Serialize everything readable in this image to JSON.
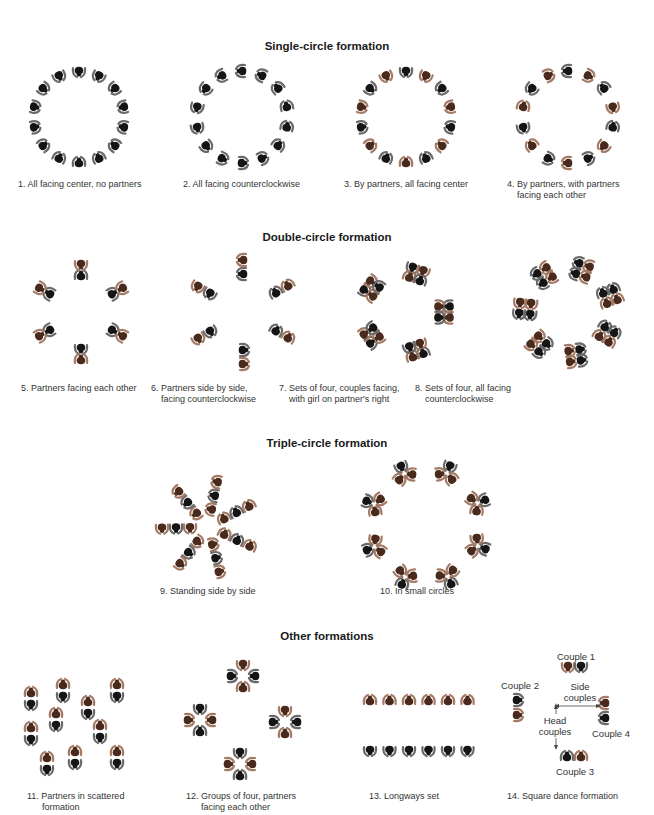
{
  "colors": {
    "man": "#151515",
    "man_arm": "#6a6a6a",
    "woman": "#4a2a1c",
    "woman_arm": "#a57b66",
    "line": "#444444"
  },
  "sections": [
    {
      "id": "single",
      "title": "Single-circle formation",
      "y": 46
    },
    {
      "id": "double",
      "title": "Double-circle formation",
      "y": 237
    },
    {
      "id": "triple",
      "title": "Triple-circle formation",
      "y": 443
    },
    {
      "id": "other",
      "title": "Other formations",
      "y": 636
    }
  ],
  "captions": [
    {
      "n": 1,
      "text": "1. All facing center, no partners",
      "x": 18,
      "y": 183,
      "w": 130,
      "align": "left"
    },
    {
      "n": 2,
      "text": "2. All facing counterclockwise",
      "x": 183,
      "y": 183,
      "w": 130,
      "align": "left"
    },
    {
      "n": 3,
      "text": "3. By partners, all facing center",
      "x": 343,
      "y": 183,
      "w": 140,
      "align": "left"
    },
    {
      "n": 4,
      "text": "4. By partners, with partners\n    facing each other",
      "x": 505,
      "y": 183,
      "w": 140,
      "align": "left"
    },
    {
      "n": 5,
      "text": "5. Partners facing each other",
      "x": 21,
      "y": 383,
      "w": 130,
      "align": "left"
    },
    {
      "n": 6,
      "text": "6. Partners side by side,\n    facing counterclockwise",
      "x": 187,
      "y": 383,
      "w": 130,
      "align": "left"
    },
    {
      "n": 7,
      "text": "7. Sets of four, couples facing,\n    with girl on partner's right",
      "x": 343,
      "y": 383,
      "w": 140,
      "align": "left"
    },
    {
      "n": 8,
      "text": "8. Sets of four, all facing\n    counterclockwise",
      "x": 512,
      "y": 383,
      "w": 130,
      "align": "left"
    },
    {
      "n": 9,
      "text": "9. Standing side by side",
      "x": 160,
      "y": 590,
      "w": 130,
      "align": "left"
    },
    {
      "n": 10,
      "text": "10. In small circles",
      "x": 380,
      "y": 590,
      "w": 130,
      "align": "left"
    },
    {
      "n": 11,
      "text": "11. Partners in scattered\n      formation",
      "x": 27,
      "y": 792,
      "w": 130,
      "align": "left"
    },
    {
      "n": 12,
      "text": "12. Groups of four, partners\n      facing each other",
      "x": 186,
      "y": 792,
      "w": 130,
      "align": "left"
    },
    {
      "n": 13,
      "text": "13. Longways set",
      "x": 370,
      "y": 792,
      "w": 130,
      "align": "left"
    },
    {
      "n": 14,
      "text": "14. Square dance formation",
      "x": 507,
      "y": 792,
      "w": 140,
      "align": "left"
    }
  ],
  "square_labels": [
    {
      "text": "Couple 1",
      "x": 575,
      "y": 650
    },
    {
      "text": "Couple 2",
      "x": 500,
      "y": 680
    },
    {
      "text": "Side\ncouples",
      "x": 563,
      "y": 680
    },
    {
      "text": "Head\ncouples",
      "x": 537,
      "y": 714
    },
    {
      "text": "Couple 4",
      "x": 589,
      "y": 728
    },
    {
      "text": "Couple 3",
      "x": 571,
      "y": 765
    }
  ],
  "figures": [
    {
      "n": 1,
      "type": "ring",
      "cx": 79,
      "cy": 117,
      "r": 46,
      "count": 14,
      "facing": "in",
      "pattern": "m"
    },
    {
      "n": 2,
      "type": "ring",
      "cx": 242,
      "cy": 117,
      "r": 46,
      "count": 14,
      "facing": "ccw",
      "pattern": "m"
    },
    {
      "n": 3,
      "type": "ring",
      "cx": 406,
      "cy": 117,
      "r": 46,
      "count": 14,
      "facing": "in",
      "pattern": "mw"
    },
    {
      "n": 4,
      "type": "ring",
      "cx": 568,
      "cy": 117,
      "r": 46,
      "count": 14,
      "facing": "pairs",
      "pattern": "mw"
    },
    {
      "n": 5,
      "type": "pairs-radial",
      "cx": 81,
      "cy": 312,
      "r": 42,
      "count": 6,
      "gap": 12,
      "mode": "face"
    },
    {
      "n": 6,
      "type": "pairs-radial",
      "cx": 243,
      "cy": 312,
      "r": 38,
      "count": 6,
      "gap": 14,
      "mode": "side"
    },
    {
      "n": 7,
      "type": "quads",
      "cx": 404,
      "cy": 312,
      "r": 40,
      "count": 5,
      "mode": "facing"
    },
    {
      "n": 8,
      "type": "quads",
      "cx": 569,
      "cy": 312,
      "r": 44,
      "count": 7,
      "mode": "ccw"
    },
    {
      "n": 9,
      "type": "spokes",
      "cx": 208,
      "cy": 527,
      "r1": 18,
      "r2": 46,
      "count": 7
    },
    {
      "n": 10,
      "type": "triangles",
      "cx": 426,
      "cy": 525,
      "r": 56,
      "count": 8
    },
    {
      "n": 11,
      "type": "scatter",
      "points": [
        [
          31,
          693
        ],
        [
          63,
          685
        ],
        [
          117,
          685
        ],
        [
          88,
          702
        ],
        [
          56,
          714
        ],
        [
          31,
          728
        ],
        [
          100,
          726
        ],
        [
          47,
          758
        ],
        [
          75,
          752
        ],
        [
          117,
          752
        ]
      ]
    },
    {
      "n": 12,
      "type": "fours",
      "points": [
        [
          243,
          676
        ],
        [
          200,
          720
        ],
        [
          285,
          722
        ],
        [
          240,
          764
        ]
      ]
    },
    {
      "n": 13,
      "type": "longways",
      "x0": 370,
      "dx": 19.5,
      "count": 6,
      "yTop": 701,
      "yBot": 750
    },
    {
      "n": 14,
      "type": "square"
    }
  ]
}
